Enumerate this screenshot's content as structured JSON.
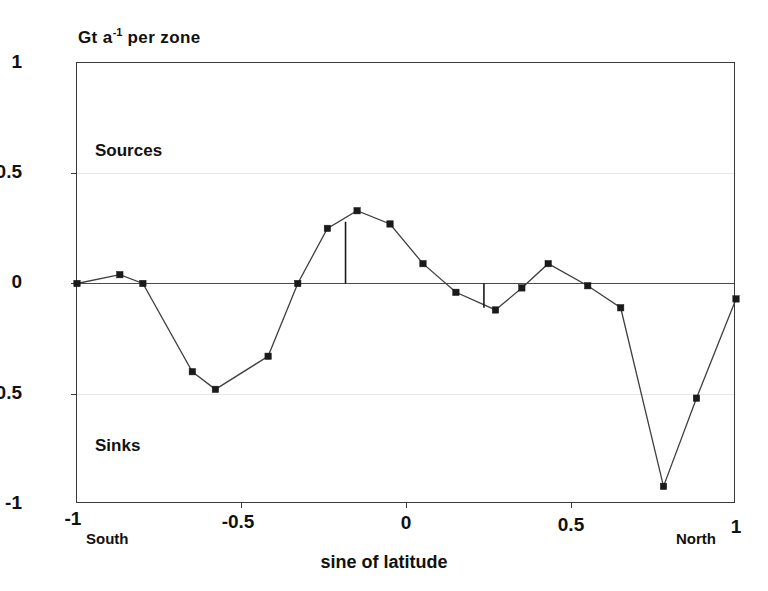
{
  "chart_data": {
    "type": "line",
    "title": "Gt a-1 per zone",
    "title_parts": {
      "base_before": "Gt a",
      "superscript": "-1",
      "base_after": " per zone"
    },
    "xlabel": "sine of latitude",
    "ylabel": "Gt a-1 per zone",
    "xlim": [
      -1,
      1
    ],
    "ylim": [
      -1,
      1
    ],
    "xticks": [
      "-1",
      "-0.5",
      "0",
      "0.5",
      "1"
    ],
    "xtick_values": [
      -1,
      -0.5,
      0,
      0.5,
      1
    ],
    "yticks": [
      "1",
      "0.5",
      "0",
      "-0.5",
      "-1"
    ],
    "ytick_values": [
      1,
      0.5,
      0,
      -0.5,
      -1
    ],
    "grid": true,
    "legend": null,
    "legend_position": "none",
    "markers": "filled-square",
    "series": [
      {
        "name": "zonal flux",
        "x": [
          -1.0,
          -0.87,
          -0.8,
          -0.65,
          -0.58,
          -0.42,
          -0.33,
          -0.24,
          -0.15,
          -0.05,
          0.05,
          0.15,
          0.27,
          0.35,
          0.43,
          0.55,
          0.65,
          0.78,
          0.88,
          1.0
        ],
        "values": [
          0.0,
          0.04,
          0.0,
          -0.4,
          -0.48,
          -0.33,
          0.0,
          0.25,
          0.33,
          0.27,
          0.09,
          -0.04,
          -0.12,
          -0.02,
          0.09,
          -0.01,
          -0.11,
          -0.92,
          -0.52,
          -0.07
        ]
      }
    ],
    "errorbars": [
      {
        "x": -0.185,
        "y_top": 0.28,
        "y_bottom": 0.0
      },
      {
        "x": 0.235,
        "y_top": 0.0,
        "y_bottom": -0.11
      }
    ],
    "annotations": [
      {
        "text": "Sources",
        "x": -0.9,
        "y": 0.63,
        "align": "left"
      },
      {
        "text": "Sinks",
        "x": -0.9,
        "y": -0.69,
        "align": "left"
      },
      {
        "text": "South",
        "x": -0.97,
        "y": -1.12,
        "align": "left"
      },
      {
        "text": "North",
        "x": 0.82,
        "y": -1.12,
        "align": "left"
      }
    ],
    "colors": {
      "line": "#3f3f3f",
      "marker": "#1a1a1a",
      "zero_line": "#4a4a4a",
      "grid": "#e6e6e6",
      "frame": "#3a3a3a",
      "background": "#ffffff",
      "text": "#111111"
    }
  },
  "axis": {
    "y_labels": [
      "1",
      "0.5",
      "0",
      "-0.5",
      "-1"
    ],
    "x_labels": [
      "-1",
      "-0.5",
      "0",
      "0.5",
      "1"
    ],
    "x_caption": "sine of latitude"
  },
  "annotations": {
    "sources": "Sources",
    "sinks": "Sinks",
    "south": "South",
    "north": "North"
  }
}
